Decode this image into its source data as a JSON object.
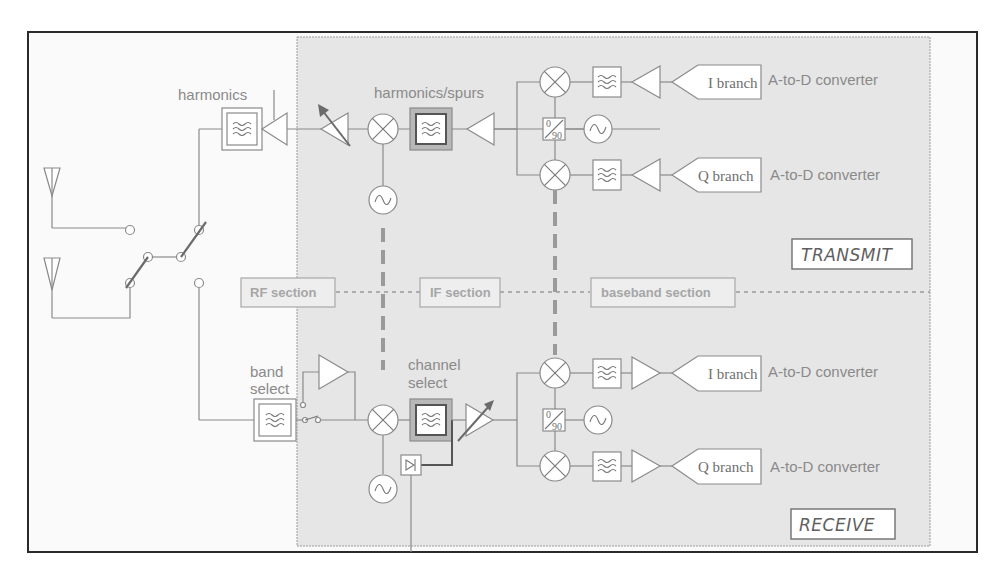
{
  "diagram": {
    "colors": {
      "frame_border": "#2a2a2a",
      "shaded_region": "#e6e6e6",
      "line": "#8a8a8a",
      "label_text": "#8a8a8a",
      "mode_text": "#5f5f5f"
    },
    "transmit": {
      "mode_label": "TRANSMIT",
      "filter_label_rf": "harmonics",
      "filter_label_if": "harmonics/spurs",
      "i_branch_label": "I branch",
      "q_branch_label": "Q branch",
      "i_converter_label": "A-to-D converter",
      "q_converter_label": "A-to-D converter",
      "phase_shifter": {
        "top": "0",
        "bottom": "90"
      }
    },
    "receive": {
      "mode_label": "RECEIVE",
      "filter_label_rf_line1": "band",
      "filter_label_rf_line2": "select",
      "filter_label_if_line1": "channel",
      "filter_label_if_line2": "select",
      "i_branch_label": "I branch",
      "q_branch_label": "Q branch",
      "i_converter_label": "A-to-D converter",
      "q_converter_label": "A-to-D converter",
      "phase_shifter": {
        "top": "0",
        "bottom": "90"
      }
    },
    "sections": [
      {
        "label": "RF section"
      },
      {
        "label": "IF section"
      },
      {
        "label": "baseband section"
      }
    ],
    "icons": [
      "antenna-icon",
      "switch-icon",
      "filter-icon",
      "amplifier-icon",
      "variable-gain-amplifier-icon",
      "mixer-icon",
      "oscillator-icon",
      "phase-shifter-icon",
      "detector-diode-icon",
      "converter-pentagon-icon"
    ]
  }
}
